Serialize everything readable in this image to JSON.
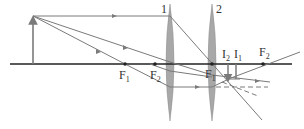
{
  "diagram": {
    "type": "two-lens optical ray diagram",
    "colors": {
      "axis": "#222222",
      "ray": "#7a7a7a",
      "lens_fill": "#a8a8a8",
      "object": "#7a7a7a",
      "label": "#333333"
    },
    "lenses": [
      {
        "id": "1",
        "label": "1",
        "x": 170
      },
      {
        "id": "2",
        "label": "2",
        "x": 212
      }
    ],
    "focal_points": [
      {
        "label_main": "F",
        "label_sub": "1",
        "x": 125,
        "lens": "1",
        "side": "left"
      },
      {
        "label_main": "F",
        "label_sub": "2",
        "x": 155,
        "lens": "2",
        "side": "left"
      },
      {
        "label_main": "F",
        "label_sub": "1",
        "x": 212,
        "lens": "1",
        "side": "right"
      },
      {
        "label_main": "F",
        "label_sub": "2",
        "x": 263,
        "lens": "2",
        "side": "right"
      }
    ],
    "images": [
      {
        "label_main": "I",
        "label_sub": "2",
        "x": 228
      },
      {
        "label_main": "I",
        "label_sub": "1",
        "x": 236
      }
    ],
    "object": {
      "label": "object arrow",
      "x": 33
    }
  }
}
